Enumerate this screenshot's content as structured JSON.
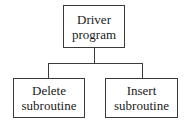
{
  "diagram": {
    "type": "hierarchy",
    "nodes": [
      {
        "id": "driver",
        "lines": [
          "Driver",
          "program"
        ],
        "level": 0
      },
      {
        "id": "delete",
        "lines": [
          "Delete",
          "subroutine"
        ],
        "level": 1
      },
      {
        "id": "insert",
        "lines": [
          "Insert",
          "subroutine"
        ],
        "level": 1
      }
    ],
    "edges": [
      {
        "from": "driver",
        "to": "delete"
      },
      {
        "from": "driver",
        "to": "insert"
      }
    ],
    "colors": {
      "line": "#3a3a3a",
      "text": "#1a1a1a",
      "background": "#ffffff"
    }
  }
}
